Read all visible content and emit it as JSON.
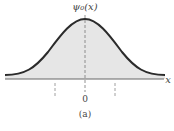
{
  "figure": {
    "ylabel": "ψ₀(x)",
    "xlabel": "x",
    "origin_label": "0",
    "caption": "(a)"
  },
  "colors": {
    "curve": "#2b2b2b",
    "fill": "#e6e6e6",
    "axis": "#555555",
    "dashed": "#777777"
  }
}
